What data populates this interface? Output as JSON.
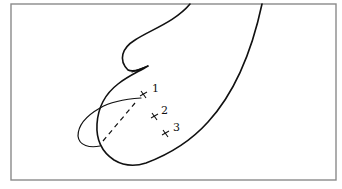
{
  "diagram": {
    "points": [
      {
        "id": "point-1",
        "label": "1",
        "marker": "cross"
      },
      {
        "id": "point-2",
        "label": "2",
        "marker": "cross"
      },
      {
        "id": "point-3",
        "label": "3",
        "marker": "cross"
      }
    ],
    "colors": {
      "line": "#111111",
      "frame": "#8a8a8a",
      "background": "#ffffff"
    }
  }
}
